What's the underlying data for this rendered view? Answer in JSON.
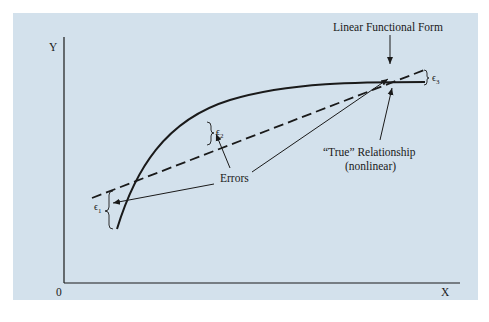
{
  "diagram": {
    "axes": {
      "y_label": "Y",
      "x_label": "X",
      "origin_label": "0"
    },
    "labels": {
      "linear_form": "Linear Functional Form",
      "true_relationship_line1": "“True” Relationship",
      "true_relationship_line2": "(nonlinear)",
      "errors": "Errors"
    },
    "error_terms": [
      {
        "symbol": "ϵ",
        "subscript": "1"
      },
      {
        "symbol": "ϵ",
        "subscript": "2"
      },
      {
        "symbol": "ϵ",
        "subscript": "3"
      }
    ],
    "colors": {
      "panel": "#d3e1ec",
      "ink": "#1a1a1a"
    }
  }
}
